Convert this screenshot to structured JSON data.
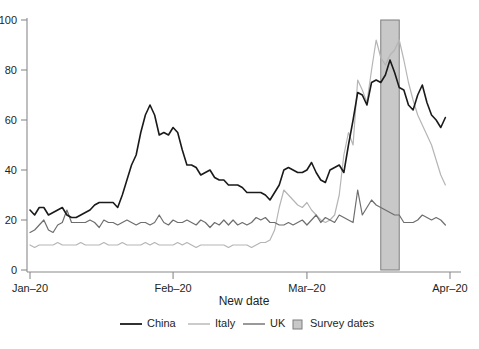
{
  "chart_data": {
    "type": "line",
    "title": "",
    "xlabel": "New date",
    "ylabel": "",
    "xlim": [
      0,
      91
    ],
    "ylim": [
      0,
      100
    ],
    "grid": false,
    "legend_position": "bottom",
    "x_tick_labels": [
      "Jan–20",
      "Feb–20",
      "Mar–20",
      "Apr–20"
    ],
    "x_tick_values": [
      0,
      31,
      60,
      91
    ],
    "y_tick_labels": [
      "0",
      "20",
      "40",
      "60",
      "80",
      "100"
    ],
    "y_tick_values": [
      0,
      20,
      40,
      60,
      80,
      100
    ],
    "colors": {
      "China": "#1a1a1a",
      "Italy": "#b5b5b5",
      "UK": "#6e6e6e",
      "Survey dates fill": "#c8c8c8",
      "Survey dates edge": "#7d7d7d",
      "axis": "#8a8a8a",
      "background": "#ffffff"
    },
    "annotations": [
      {
        "name": "Survey dates",
        "type": "vertical-band",
        "x_start": 76,
        "x_end": 80,
        "y_start": 0,
        "y_end": 100
      }
    ],
    "series": [
      {
        "name": "China",
        "color": "#1a1a1a",
        "x": [
          0,
          1,
          2,
          3,
          4,
          5,
          6,
          7,
          8,
          9,
          10,
          11,
          12,
          13,
          14,
          15,
          16,
          17,
          18,
          19,
          20,
          21,
          22,
          23,
          24,
          25,
          26,
          27,
          28,
          29,
          30,
          31,
          32,
          33,
          34,
          35,
          36,
          37,
          38,
          39,
          40,
          41,
          42,
          43,
          44,
          45,
          46,
          47,
          48,
          49,
          50,
          51,
          52,
          53,
          54,
          55,
          56,
          57,
          58,
          59,
          60,
          61,
          62,
          63,
          64,
          65,
          66,
          67,
          68,
          69,
          70,
          71,
          72,
          73,
          74,
          75,
          76,
          77,
          78,
          79,
          80,
          81,
          82,
          83,
          84,
          85,
          86,
          87,
          88,
          89,
          90
        ],
        "values": [
          24,
          22,
          25,
          25,
          22,
          23,
          24,
          25,
          22,
          21,
          21,
          22,
          23,
          24,
          26,
          27,
          27,
          27,
          27,
          25,
          30,
          36,
          42,
          46,
          55,
          62,
          66,
          62,
          54,
          55,
          54,
          57,
          55,
          48,
          42,
          42,
          41,
          38,
          39,
          40,
          37,
          36,
          36,
          34,
          34,
          34,
          33,
          31,
          31,
          31,
          31,
          30,
          28,
          31,
          34,
          40,
          41,
          40,
          39,
          39,
          40,
          43,
          39,
          36,
          35,
          40,
          41,
          42,
          39,
          50,
          60,
          71,
          70,
          66,
          75,
          76,
          75,
          78,
          84,
          79,
          73,
          72,
          66,
          64,
          70,
          74,
          67,
          62,
          60,
          57,
          61
        ]
      },
      {
        "name": "Italy",
        "color": "#b5b5b5",
        "x": [
          0,
          1,
          2,
          3,
          4,
          5,
          6,
          7,
          8,
          9,
          10,
          11,
          12,
          13,
          14,
          15,
          16,
          17,
          18,
          19,
          20,
          21,
          22,
          23,
          24,
          25,
          26,
          27,
          28,
          29,
          30,
          31,
          32,
          33,
          34,
          35,
          36,
          37,
          38,
          39,
          40,
          41,
          42,
          43,
          44,
          45,
          46,
          47,
          48,
          49,
          50,
          51,
          52,
          53,
          54,
          55,
          56,
          57,
          58,
          59,
          60,
          61,
          62,
          63,
          64,
          65,
          66,
          67,
          68,
          69,
          70,
          71,
          72,
          73,
          74,
          75,
          76,
          77,
          78,
          79,
          80,
          81,
          82,
          83,
          84,
          85,
          86,
          87,
          88,
          89,
          90
        ],
        "values": [
          10,
          9,
          10,
          10,
          10,
          10,
          11,
          10,
          10,
          10,
          10,
          11,
          10,
          10,
          10,
          10,
          11,
          10,
          10,
          10,
          11,
          10,
          10,
          10,
          10,
          11,
          10,
          11,
          10,
          10,
          10,
          10,
          11,
          10,
          11,
          10,
          9,
          10,
          10,
          10,
          10,
          10,
          10,
          9,
          10,
          10,
          10,
          10,
          9,
          10,
          11,
          11,
          12,
          16,
          25,
          32,
          30,
          28,
          26,
          25,
          27,
          24,
          22,
          20,
          19,
          20,
          22,
          30,
          46,
          55,
          50,
          76,
          72,
          67,
          80,
          92,
          85,
          82,
          86,
          88,
          92,
          84,
          75,
          68,
          62,
          58,
          54,
          50,
          44,
          38,
          34
        ]
      },
      {
        "name": "UK",
        "color": "#6e6e6e",
        "x": [
          0,
          1,
          2,
          3,
          4,
          5,
          6,
          7,
          8,
          9,
          10,
          11,
          12,
          13,
          14,
          15,
          16,
          17,
          18,
          19,
          20,
          21,
          22,
          23,
          24,
          25,
          26,
          27,
          28,
          29,
          30,
          31,
          32,
          33,
          34,
          35,
          36,
          37,
          38,
          39,
          40,
          41,
          42,
          43,
          44,
          45,
          46,
          47,
          48,
          49,
          50,
          51,
          52,
          53,
          54,
          55,
          56,
          57,
          58,
          59,
          60,
          61,
          62,
          63,
          64,
          65,
          66,
          67,
          68,
          69,
          70,
          71,
          72,
          73,
          74,
          75,
          76,
          77,
          78,
          79,
          80,
          81,
          82,
          83,
          84,
          85,
          86,
          87,
          88,
          89,
          90
        ],
        "values": [
          15,
          16,
          18,
          20,
          16,
          15,
          18,
          19,
          24,
          19,
          19,
          19,
          19,
          20,
          19,
          17,
          20,
          19,
          19,
          18,
          19,
          20,
          19,
          18,
          19,
          19,
          18,
          19,
          22,
          19,
          18,
          20,
          19,
          19,
          20,
          19,
          18,
          20,
          19,
          17,
          19,
          18,
          20,
          18,
          20,
          18,
          19,
          18,
          19,
          21,
          20,
          21,
          19,
          19,
          18,
          18,
          19,
          18,
          19,
          20,
          18,
          20,
          22,
          19,
          21,
          20,
          19,
          22,
          21,
          20,
          19,
          32,
          22,
          25,
          28,
          26,
          25,
          24,
          23,
          22,
          22,
          19,
          19,
          19,
          20,
          22,
          21,
          20,
          21,
          20,
          18
        ]
      }
    ],
    "legend": [
      {
        "label": "China",
        "marker": "line",
        "color": "#1a1a1a"
      },
      {
        "label": "Italy",
        "marker": "line",
        "color": "#b5b5b5"
      },
      {
        "label": "UK",
        "marker": "line",
        "color": "#6e6e6e"
      },
      {
        "label": "Survey dates",
        "marker": "square",
        "color": "#c8c8c8"
      }
    ]
  },
  "axes": {
    "x_title": "New date",
    "x_ticks": [
      "Jan–20",
      "Feb–20",
      "Mar–20",
      "Apr–20"
    ],
    "y_ticks": [
      "0",
      "20",
      "40",
      "60",
      "80",
      "100"
    ]
  },
  "legend": {
    "items": [
      {
        "label": "China"
      },
      {
        "label": "Italy"
      },
      {
        "label": "UK"
      },
      {
        "label": "Survey dates"
      }
    ]
  }
}
